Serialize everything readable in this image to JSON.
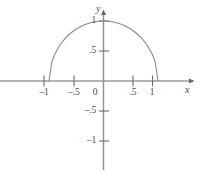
{
  "chart_data": {
    "type": "line",
    "title": "",
    "subtitle": "",
    "xlabel": "x",
    "ylabel": "y",
    "xlim": [
      -1.9,
      1.6
    ],
    "ylim": [
      -1.3,
      1.15
    ],
    "grid": false,
    "legend": null,
    "x_ticks": [
      {
        "value": -1,
        "label": "–1"
      },
      {
        "value": -0.5,
        "label": "–.5"
      },
      {
        "value": 0,
        "label": "0"
      },
      {
        "value": 0.5,
        "label": ".5"
      },
      {
        "value": 1,
        "label": "1"
      }
    ],
    "y_ticks": [
      {
        "value": 1,
        "label": "1"
      },
      {
        "value": 0.5,
        "label": ".5"
      },
      {
        "value": -0.5,
        "label": "–.5"
      },
      {
        "value": -1,
        "label": "–1"
      }
    ],
    "series": [
      {
        "name": "semicircle",
        "equation": "y = sqrt(1 - x^2)",
        "x": [
          -1,
          -0.95,
          -0.9,
          -0.8,
          -0.7,
          -0.6,
          -0.5,
          -0.4,
          -0.3,
          -0.2,
          -0.1,
          0,
          0.1,
          0.2,
          0.3,
          0.4,
          0.5,
          0.6,
          0.7,
          0.8,
          0.9,
          0.95,
          1
        ],
        "values": [
          0,
          0.312,
          0.436,
          0.6,
          0.714,
          0.8,
          0.866,
          0.917,
          0.954,
          0.98,
          0.995,
          1,
          0.995,
          0.98,
          0.954,
          0.917,
          0.866,
          0.8,
          0.714,
          0.6,
          0.436,
          0.312,
          0
        ]
      }
    ]
  },
  "colors": {
    "axis": "#6b6b6b",
    "curve": "#8a8a8a",
    "tick_text": "#4c4c4c",
    "background": "#ffffff"
  }
}
